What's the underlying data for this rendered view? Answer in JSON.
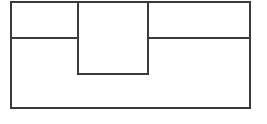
{
  "figure": {
    "type": "line-drawing",
    "canvas": {
      "width": 267,
      "height": 124,
      "background": "#ffffff"
    },
    "stroke": {
      "color": "#3a3a3a",
      "width": 2,
      "linecap": "square",
      "linejoin": "miter",
      "fill": "none"
    },
    "geometry": {
      "outer_rectangle": {
        "x1": 11,
        "y1": 2,
        "x2": 250,
        "y2": 108
      },
      "center_rectangle": {
        "x1": 78,
        "y1": 2,
        "x2": 148,
        "y2": 74
      },
      "divider_y": 38,
      "divider_left_segment": {
        "x1": 11,
        "y": 38,
        "x2": 78
      },
      "divider_right_segment": {
        "x1": 148,
        "y": 38,
        "x2": 250
      },
      "center_left_vertical": {
        "x": 78,
        "y1": 2,
        "y2": 74
      },
      "center_right_vertical": {
        "x": 148,
        "y1": 2,
        "y2": 74
      },
      "center_bottom_horizontal": {
        "x1": 78,
        "y": 74,
        "x2": 148
      }
    },
    "regions": [
      {
        "name": "top-left-cell",
        "x": 11,
        "y": 2,
        "width": 67,
        "height": 36,
        "label": ""
      },
      {
        "name": "top-center-cell",
        "x": 78,
        "y": 2,
        "width": 70,
        "height": 72,
        "label": ""
      },
      {
        "name": "top-right-cell",
        "x": 148,
        "y": 2,
        "width": 102,
        "height": 36,
        "label": ""
      },
      {
        "name": "bottom-cell",
        "x": 11,
        "y": 38,
        "width": 239,
        "height": 70,
        "label": ""
      }
    ]
  }
}
